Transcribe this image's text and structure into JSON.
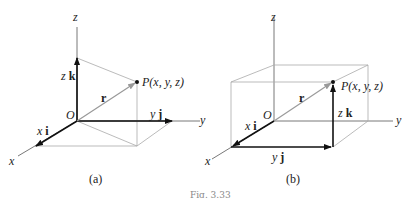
{
  "figure_caption": "Fig. 3.33",
  "panels": [
    {
      "id": "a",
      "caption": "(a)",
      "labels": {
        "z_axis": "z",
        "y_axis": "y",
        "x_axis": "x",
        "origin": "O",
        "zk_coef": "z",
        "zk_vec": "k",
        "yj_coef": "y",
        "yj_vec": "j",
        "xi_coef": "x",
        "xi_vec": "i",
        "r": "r",
        "point": "P(x, y, z)"
      }
    },
    {
      "id": "b",
      "caption": "(b)",
      "labels": {
        "z_axis": "z",
        "y_axis": "y",
        "x_axis": "x",
        "origin": "O",
        "zk_coef": "z",
        "zk_vec": "k",
        "yj_coef": "y",
        "yj_vec": "j",
        "xi_coef": "x",
        "xi_vec": "i",
        "r": "r",
        "point": "P(x, y, z)"
      }
    }
  ],
  "colors": {
    "axis": "#555555",
    "vector": "#111111",
    "guide": "#aaaaaa"
  }
}
